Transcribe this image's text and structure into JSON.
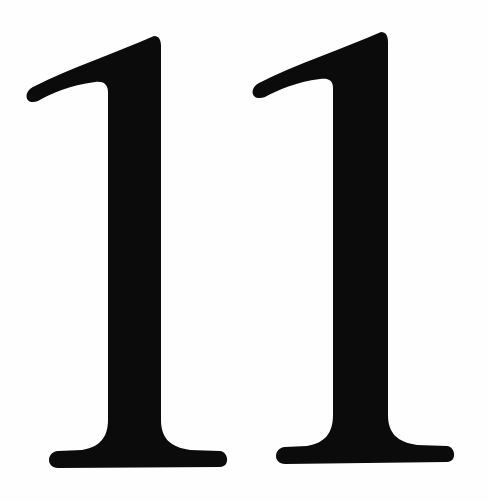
{
  "image": {
    "text": "11",
    "digits": [
      {
        "char": "1",
        "color": "#0b0b0b"
      },
      {
        "char": "1",
        "color": "#0b0b0b"
      }
    ],
    "background": "#fefefe"
  }
}
